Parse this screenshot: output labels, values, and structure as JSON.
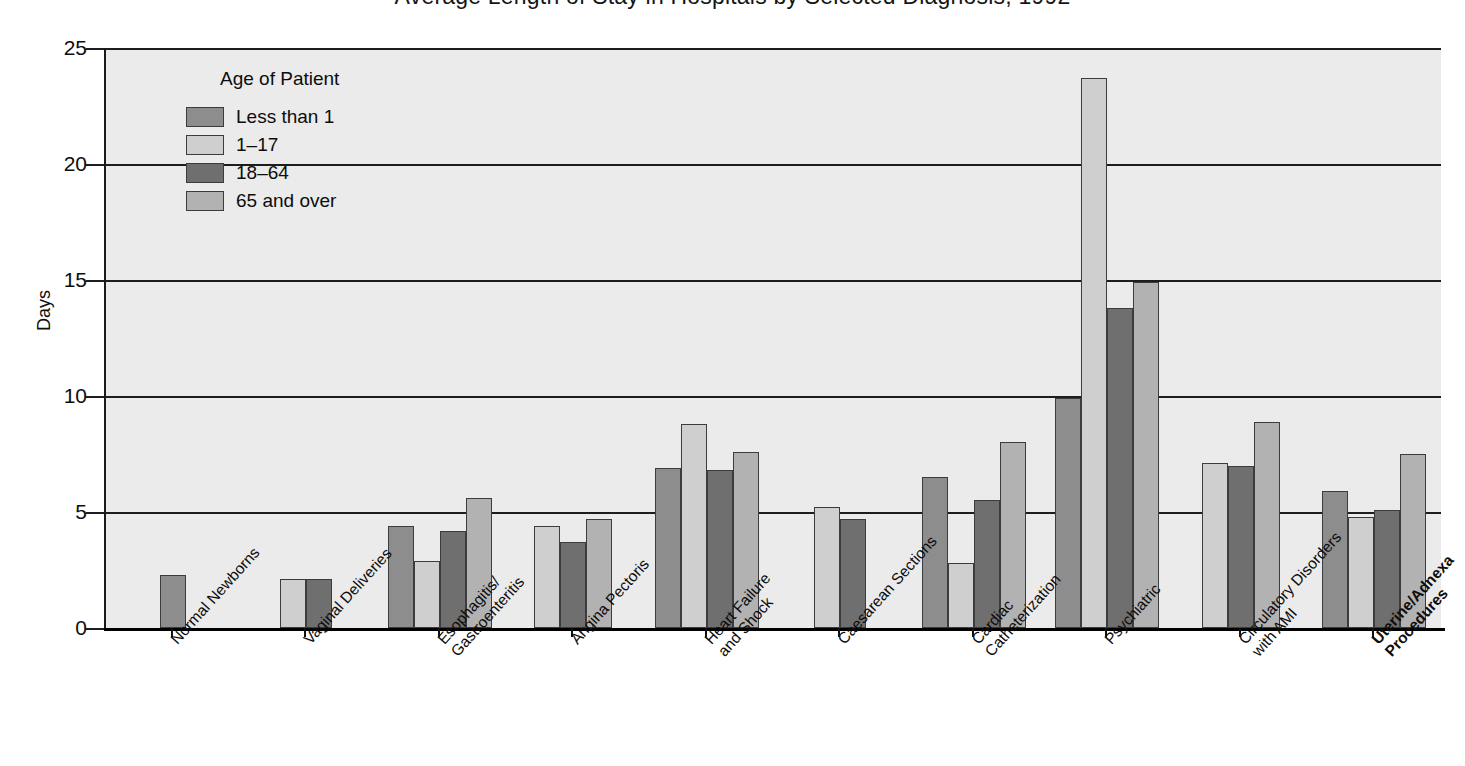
{
  "chart_data": {
    "type": "bar",
    "title": "Average Length of Stay in Hospitals by Selected Diagnosis, 1992",
    "xlabel": "",
    "ylabel": "Days",
    "ylim": [
      0,
      25
    ],
    "yticks": [
      0,
      5,
      10,
      15,
      20,
      25
    ],
    "ytick_labels": [
      "0",
      "5",
      "10",
      "15",
      "20",
      "25"
    ],
    "grid": true,
    "legend_title": "Age of Patient",
    "legend_position": "upper-left-inside",
    "categories": [
      "Normal Newborns",
      "Vaginal Deliveries",
      "Esophagitis/\nGastroenteritis",
      "Angina Pectoris",
      "Heart Failure\nand Shock",
      "Caesarean Sections",
      "Cardiac\nCatheterization",
      "Psychiatric",
      "Circulatory Disorders\nwith AMI",
      "Uterine/Adnexa\nProcedures"
    ],
    "series": [
      {
        "name": "Less than 1",
        "color": "#8d8d8d",
        "values": [
          2.3,
          null,
          4.4,
          null,
          6.9,
          null,
          6.5,
          9.9,
          null,
          5.9
        ]
      },
      {
        "name": "1-17",
        "color": "#cfcfcf",
        "values": [
          null,
          2.1,
          2.9,
          4.4,
          8.8,
          5.2,
          2.8,
          23.7,
          7.1,
          4.8
        ]
      },
      {
        "name": "18-64",
        "color": "#6f6f6f",
        "values": [
          null,
          2.1,
          4.2,
          3.7,
          6.8,
          4.7,
          5.5,
          13.8,
          7.0,
          5.1
        ]
      },
      {
        "name": "65 and over",
        "color": "#b2b2b2",
        "values": [
          null,
          null,
          5.6,
          4.7,
          7.6,
          null,
          8.0,
          14.9,
          8.9,
          7.5
        ]
      }
    ]
  },
  "legend": {
    "title": "Age of Patient",
    "entries": [
      {
        "label": "Less than 1",
        "color": "#8d8d8d"
      },
      {
        "label": "1–17",
        "color": "#cfcfcf"
      },
      {
        "label": "18–64",
        "color": "#6f6f6f"
      },
      {
        "label": "65 and over",
        "color": "#b2b2b2"
      }
    ]
  },
  "axes": {
    "y_title": "Days",
    "y_tick_labels": [
      "25",
      "20",
      "15",
      "10",
      "5",
      "0"
    ],
    "x_tick_labels": [
      "Normal Newborns",
      "Vaginal Deliveries",
      "Esophagitis/\nGastroenteritis",
      "Angina Pectoris",
      "Heart Failure\nand Shock",
      "Caesarean Sections",
      "Cardiac\nCatheterization",
      "Psychiatric",
      "Circulatory Disorders\nwith AMI",
      "Uterine/Adnexa\nProcedures"
    ]
  },
  "title": {
    "text": "Average Length of Stay in Hospitals by Selected Diagnosis, 1992"
  },
  "colors": {
    "plot_background": "#ebebeb",
    "page_background": "#ffffff",
    "axis": "#111111",
    "gridline": "#1d1d1d",
    "bar_border": "#3c3c3c"
  }
}
